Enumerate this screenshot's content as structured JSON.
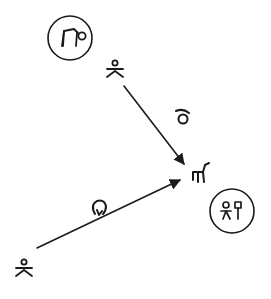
{
  "diagram": {
    "type": "sign-relation-diagram",
    "colors": {
      "ink": "#1a1a1a",
      "background": "#ffffff"
    },
    "nodes": [
      {
        "id": "circle-top",
        "kind": "circled-symbol",
        "symbol": "bent-figure-glyph"
      },
      {
        "id": "person-top",
        "kind": "person",
        "symbol": "person-glyph"
      },
      {
        "id": "target",
        "kind": "symbol",
        "symbol": "horse-like-glyph"
      },
      {
        "id": "circle-bottom",
        "kind": "circled-symbol",
        "symbol": "hangul-like-glyph",
        "text": "외"
      },
      {
        "id": "person-bottom",
        "kind": "person",
        "symbol": "person-glyph"
      }
    ],
    "edges": [
      {
        "from": "person-top",
        "to": "target",
        "label_symbol": "loop-hook-glyph"
      },
      {
        "from": "person-bottom",
        "to": "target",
        "label_symbol": "loop-down-arrow-glyph"
      }
    ]
  }
}
